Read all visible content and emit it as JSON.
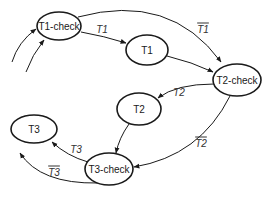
{
  "diagram": {
    "type": "state-transition",
    "colors": {
      "stroke": "#1a1a1a",
      "text": "#1a1a1a",
      "edge_label": "#333333",
      "background": "#ffffff"
    },
    "nodes": [
      {
        "id": "t1check",
        "label": "T1-check",
        "cx": 59,
        "cy": 26,
        "rx": 22,
        "ry": 14
      },
      {
        "id": "t1",
        "label": "T1",
        "cx": 147,
        "cy": 50,
        "rx": 21,
        "ry": 15
      },
      {
        "id": "t2check",
        "label": "T2-check",
        "cx": 237,
        "cy": 80,
        "rx": 24,
        "ry": 16
      },
      {
        "id": "t2",
        "label": "T2",
        "cx": 139,
        "cy": 109,
        "rx": 22,
        "ry": 16
      },
      {
        "id": "t3check",
        "label": "T3-check",
        "cx": 109,
        "cy": 169,
        "rx": 24,
        "ry": 16
      },
      {
        "id": "t3",
        "label": "T3",
        "cx": 34,
        "cy": 129,
        "rx": 23,
        "ry": 14
      }
    ],
    "edges": [
      {
        "id": "in1",
        "from": "",
        "to": "t1check",
        "label": "",
        "overbar": false,
        "path": "M12,62 Q18,42 36,29"
      },
      {
        "id": "in2",
        "from": "",
        "to": "t1check",
        "label": "",
        "overbar": false,
        "path": "M26,72 Q32,55 44,40"
      },
      {
        "id": "t1check-t1",
        "from": "t1check",
        "to": "t1",
        "label": "T1",
        "overbar": false,
        "lx": 102,
        "ly": 29,
        "path": "M81,32 Q104,36 126,43"
      },
      {
        "id": "t1check-t2check",
        "from": "t1check",
        "to": "t2check",
        "label": "T1",
        "overbar": true,
        "lx": 203,
        "ly": 29,
        "path": "M78,17 Q170,-8 221,62"
      },
      {
        "id": "t1-t2check",
        "from": "t1",
        "to": "t2check",
        "label": "",
        "overbar": false,
        "path": "M167,56 Q192,62 213,72"
      },
      {
        "id": "t2check-t2",
        "from": "t2check",
        "to": "t2",
        "label": "T2",
        "overbar": false,
        "lx": 179,
        "ly": 92,
        "path": "M214,84 Q176,84 158,98"
      },
      {
        "id": "t2check-t3check",
        "from": "t2check",
        "to": "t3check",
        "label": "T2",
        "overbar": true,
        "lx": 201,
        "ly": 143,
        "path": "M230,96 Q200,156 134,167"
      },
      {
        "id": "t2-t3check",
        "from": "t2",
        "to": "t3check",
        "label": "",
        "overbar": false,
        "path": "M129,124 Q119,138 116,153"
      },
      {
        "id": "t3check-t3",
        "from": "t3check",
        "to": "t3",
        "label": "T3",
        "overbar": false,
        "lx": 76,
        "ly": 149,
        "path": "M88,162 Q67,156 52,142"
      },
      {
        "id": "t3check-out",
        "from": "t3check",
        "to": "",
        "label": "T3",
        "overbar": true,
        "lx": 54,
        "ly": 172,
        "path": "M98,183 Q40,184 20,153"
      }
    ]
  }
}
